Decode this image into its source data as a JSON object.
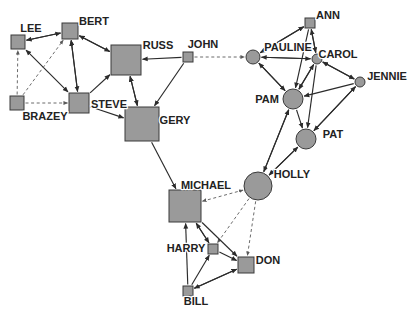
{
  "diagram": {
    "background_color": "#ffffff",
    "node_fill": "#9a9a9a",
    "node_stroke": "#3a3a3a",
    "edge_color": "#2b2b2b",
    "dashed_edge_color": "#5a5a5a",
    "label_color": "#222222"
  },
  "nodes": [
    {
      "id": "LEE",
      "label": "LEE",
      "shape": "square",
      "x": 18,
      "y": 42,
      "size": 7,
      "label_x": 31,
      "label_y": 32,
      "anchor": "middle"
    },
    {
      "id": "BERT",
      "label": "BERT",
      "shape": "square",
      "x": 70,
      "y": 31,
      "size": 8,
      "label_x": 94,
      "label_y": 25,
      "anchor": "middle"
    },
    {
      "id": "BRAZEY",
      "label": "BRAZEY",
      "shape": "square",
      "x": 17,
      "y": 103,
      "size": 7,
      "label_x": 45,
      "label_y": 120,
      "anchor": "middle"
    },
    {
      "id": "STEVE",
      "label": "STEVE",
      "shape": "square",
      "x": 79,
      "y": 103,
      "size": 10,
      "label_x": 109,
      "label_y": 108,
      "anchor": "middle"
    },
    {
      "id": "RUSS",
      "label": "RUSS",
      "shape": "square",
      "x": 126,
      "y": 60,
      "size": 15,
      "label_x": 158,
      "label_y": 49,
      "anchor": "middle"
    },
    {
      "id": "GERY",
      "label": "GERY",
      "shape": "square",
      "x": 142,
      "y": 124,
      "size": 17,
      "label_x": 175,
      "label_y": 124,
      "anchor": "middle"
    },
    {
      "id": "JOHN",
      "label": "JOHN",
      "shape": "square",
      "x": 188,
      "y": 57,
      "size": 5,
      "label_x": 203,
      "label_y": 48,
      "anchor": "middle"
    },
    {
      "id": "MICHAEL",
      "label": "MICHAEL",
      "shape": "square",
      "x": 185,
      "y": 206,
      "size": 16,
      "label_x": 206,
      "label_y": 189,
      "anchor": "middle"
    },
    {
      "id": "HARRY",
      "label": "HARRY",
      "shape": "square",
      "x": 213,
      "y": 249,
      "size": 5,
      "label_x": 186,
      "label_y": 252,
      "anchor": "middle"
    },
    {
      "id": "DON",
      "label": "DON",
      "shape": "square",
      "x": 246,
      "y": 265,
      "size": 8,
      "label_x": 268,
      "label_y": 264,
      "anchor": "middle"
    },
    {
      "id": "BILL",
      "label": "BILL",
      "shape": "square",
      "x": 188,
      "y": 291,
      "size": 5,
      "label_x": 196,
      "label_y": 305,
      "anchor": "middle"
    },
    {
      "id": "PAULINE",
      "label": "PAULINE",
      "shape": "circle",
      "x": 253,
      "y": 57,
      "size": 7,
      "label_x": 288,
      "label_y": 51,
      "anchor": "middle"
    },
    {
      "id": "ANN",
      "label": "ANN",
      "shape": "square",
      "x": 310,
      "y": 23,
      "size": 5,
      "label_x": 328,
      "label_y": 19,
      "anchor": "middle"
    },
    {
      "id": "CAROL",
      "label": "CAROL",
      "shape": "circle",
      "x": 317,
      "y": 59,
      "size": 5,
      "label_x": 338,
      "label_y": 58,
      "anchor": "middle"
    },
    {
      "id": "JENNIE",
      "label": "JENNIE",
      "shape": "circle",
      "x": 360,
      "y": 82,
      "size": 5,
      "label_x": 387,
      "label_y": 80,
      "anchor": "middle"
    },
    {
      "id": "PAM",
      "label": "PAM",
      "shape": "circle",
      "x": 293,
      "y": 99,
      "size": 10,
      "label_x": 267,
      "label_y": 103,
      "anchor": "middle"
    },
    {
      "id": "PAT",
      "label": "PAT",
      "shape": "circle",
      "x": 306,
      "y": 139,
      "size": 10,
      "label_x": 333,
      "label_y": 138,
      "anchor": "middle"
    },
    {
      "id": "HOLLY",
      "label": "HOLLY",
      "shape": "circle",
      "x": 258,
      "y": 186,
      "size": 14,
      "label_x": 292,
      "label_y": 178,
      "anchor": "middle"
    }
  ],
  "edges": [
    {
      "from": "LEE",
      "to": "BERT",
      "style": "solid",
      "arrow": "both"
    },
    {
      "from": "BERT",
      "to": "LEE",
      "style": "solid",
      "arrow": "none"
    },
    {
      "from": "LEE",
      "to": "STEVE",
      "style": "solid",
      "arrow": "both"
    },
    {
      "from": "BERT",
      "to": "STEVE",
      "style": "solid",
      "arrow": "both"
    },
    {
      "from": "BERT",
      "to": "RUSS",
      "style": "solid",
      "arrow": "end"
    },
    {
      "from": "STEVE",
      "to": "RUSS",
      "style": "solid",
      "arrow": "end"
    },
    {
      "from": "STEVE",
      "to": "BERT",
      "style": "solid",
      "arrow": "end"
    },
    {
      "from": "RUSS",
      "to": "BERT",
      "style": "solid",
      "arrow": "end"
    },
    {
      "from": "BRAZEY",
      "to": "LEE",
      "style": "dashed",
      "arrow": "end"
    },
    {
      "from": "BRAZEY",
      "to": "BERT",
      "style": "dashed",
      "arrow": "end"
    },
    {
      "from": "BRAZEY",
      "to": "STEVE",
      "style": "dashed",
      "arrow": "end"
    },
    {
      "from": "STEVE",
      "to": "GERY",
      "style": "solid",
      "arrow": "end"
    },
    {
      "from": "RUSS",
      "to": "GERY",
      "style": "solid",
      "arrow": "both"
    },
    {
      "from": "GERY",
      "to": "RUSS",
      "style": "solid",
      "arrow": "end"
    },
    {
      "from": "JOHN",
      "to": "RUSS",
      "style": "solid",
      "arrow": "end"
    },
    {
      "from": "JOHN",
      "to": "GERY",
      "style": "solid",
      "arrow": "end"
    },
    {
      "from": "JOHN",
      "to": "PAULINE",
      "style": "dashed",
      "arrow": "end"
    },
    {
      "from": "GERY",
      "to": "MICHAEL",
      "style": "solid",
      "arrow": "end"
    },
    {
      "from": "MICHAEL",
      "to": "HOLLY",
      "style": "dashed",
      "arrow": "both"
    },
    {
      "from": "HOLLY",
      "to": "HARRY",
      "style": "dashed",
      "arrow": "end"
    },
    {
      "from": "HOLLY",
      "to": "DON",
      "style": "dashed",
      "arrow": "end"
    },
    {
      "from": "MICHAEL",
      "to": "HARRY",
      "style": "solid",
      "arrow": "end"
    },
    {
      "from": "MICHAEL",
      "to": "DON",
      "style": "solid",
      "arrow": "end"
    },
    {
      "from": "HARRY",
      "to": "MICHAEL",
      "style": "solid",
      "arrow": "end"
    },
    {
      "from": "BILL",
      "to": "MICHAEL",
      "style": "solid",
      "arrow": "end"
    },
    {
      "from": "BILL",
      "to": "HARRY",
      "style": "solid",
      "arrow": "end"
    },
    {
      "from": "BILL",
      "to": "DON",
      "style": "solid",
      "arrow": "end"
    },
    {
      "from": "HARRY",
      "to": "DON",
      "style": "solid",
      "arrow": "end"
    },
    {
      "from": "DON",
      "to": "BILL",
      "style": "solid",
      "arrow": "end"
    },
    {
      "from": "PAULINE",
      "to": "ANN",
      "style": "solid",
      "arrow": "end"
    },
    {
      "from": "ANN",
      "to": "PAULINE",
      "style": "solid",
      "arrow": "end"
    },
    {
      "from": "PAULINE",
      "to": "CAROL",
      "style": "solid",
      "arrow": "end"
    },
    {
      "from": "CAROL",
      "to": "PAULINE",
      "style": "solid",
      "arrow": "end"
    },
    {
      "from": "ANN",
      "to": "CAROL",
      "style": "solid",
      "arrow": "end"
    },
    {
      "from": "CAROL",
      "to": "ANN",
      "style": "solid",
      "arrow": "end"
    },
    {
      "from": "PAULINE",
      "to": "PAM",
      "style": "solid",
      "arrow": "end"
    },
    {
      "from": "PAM",
      "to": "PAULINE",
      "style": "solid",
      "arrow": "end"
    },
    {
      "from": "ANN",
      "to": "PAM",
      "style": "solid",
      "arrow": "end"
    },
    {
      "from": "CAROL",
      "to": "PAM",
      "style": "solid",
      "arrow": "end"
    },
    {
      "from": "PAM",
      "to": "CAROL",
      "style": "solid",
      "arrow": "end"
    },
    {
      "from": "CAROL",
      "to": "JENNIE",
      "style": "solid",
      "arrow": "end"
    },
    {
      "from": "JENNIE",
      "to": "CAROL",
      "style": "solid",
      "arrow": "end"
    },
    {
      "from": "JENNIE",
      "to": "PAM",
      "style": "solid",
      "arrow": "end"
    },
    {
      "from": "PAM",
      "to": "PAT",
      "style": "solid",
      "arrow": "end"
    },
    {
      "from": "CAROL",
      "to": "PAT",
      "style": "solid",
      "arrow": "end"
    },
    {
      "from": "PAT",
      "to": "JENNIE",
      "style": "solid",
      "arrow": "end"
    },
    {
      "from": "JENNIE",
      "to": "PAT",
      "style": "solid",
      "arrow": "end"
    },
    {
      "from": "PAM",
      "to": "HOLLY",
      "style": "solid",
      "arrow": "end"
    },
    {
      "from": "HOLLY",
      "to": "PAM",
      "style": "solid",
      "arrow": "end"
    },
    {
      "from": "PAT",
      "to": "HOLLY",
      "style": "solid",
      "arrow": "end"
    },
    {
      "from": "HOLLY",
      "to": "PAT",
      "style": "solid",
      "arrow": "end"
    }
  ]
}
